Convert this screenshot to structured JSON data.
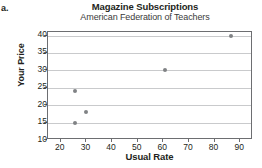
{
  "part_label": "a.",
  "chart_data": {
    "type": "scatter",
    "title": "Magazine Subscriptions",
    "subtitle": "American Federation of Teachers",
    "xlabel": "Usual Rate",
    "ylabel": "Your Price",
    "xlim": [
      15,
      95
    ],
    "ylim": [
      10,
      41
    ],
    "xticks": [
      20,
      30,
      40,
      50,
      60,
      70,
      80,
      90
    ],
    "yticks": [
      10,
      15,
      20,
      25,
      30,
      35,
      40
    ],
    "xtick_labels": [
      "20",
      "30",
      "40",
      "50",
      "60",
      "70",
      "80",
      "90"
    ],
    "ytick_labels": [
      "10",
      "15",
      "20",
      "25",
      "30",
      "35",
      "40"
    ],
    "grid": "horizontal",
    "legend": null,
    "marker_color": "#808285",
    "points": [
      {
        "x": 25.5,
        "y": 15
      },
      {
        "x": 25.7,
        "y": 24
      },
      {
        "x": 30,
        "y": 18
      },
      {
        "x": 60.5,
        "y": 30
      },
      {
        "x": 86.5,
        "y": 40
      }
    ]
  }
}
